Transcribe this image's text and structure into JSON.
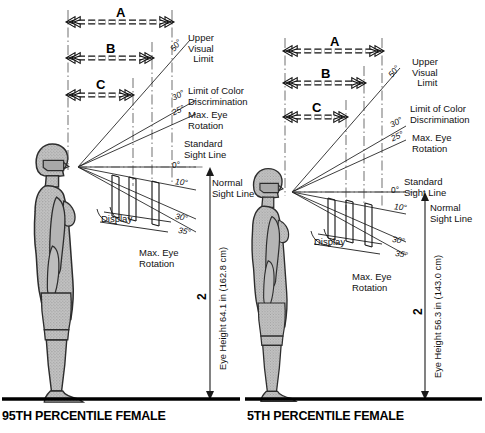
{
  "figure": {
    "title_visible": false,
    "figure_number": "2",
    "colors": {
      "body_fill": "#b9b9b9",
      "body_outline": "#2a2a2a",
      "line": "#1a1a1a",
      "ground": "#000000",
      "text": "#111111",
      "background": "#ffffff"
    }
  },
  "panels": [
    {
      "id": "left",
      "caption": "95TH PERCENTILE FEMALE",
      "eye_height_label": "Eye Height 64.1 in (162.8 cm)",
      "eye_height_in": 64.1,
      "eye_height_cm": 162.8,
      "figure_number": "2",
      "dimension_arrows": [
        {
          "label": "A"
        },
        {
          "label": "B"
        },
        {
          "label": "C"
        }
      ],
      "sight_lines": [
        {
          "angle_label": "50°",
          "name": "Upper Visual Limit"
        },
        {
          "angle_label": "30°",
          "name": "Limit of Color Discrimination"
        },
        {
          "angle_label": "25°",
          "name": "Max. Eye Rotation"
        },
        {
          "angle_label": "0°",
          "name": "Standard Sight Line"
        },
        {
          "angle_label": "10°",
          "name": "Normal Sight Line"
        },
        {
          "angle_label": "30°",
          "name": "Max. Eye Rotation lower"
        },
        {
          "angle_label": "35°",
          "name": "Max. Eye Rotation lower limit"
        }
      ],
      "callouts": {
        "upper_visual_limit": "Upper\nVisual\n  Limit",
        "limit_of_color": "Limit of Color\nDiscrimination",
        "max_eye_rotation_upper": "Max. Eye\nRotation",
        "standard_sight_line": "Standard\nSight Line",
        "normal_sight_line": "Normal\nSight Line",
        "display": "Display",
        "max_eye_rotation_lower": "Max. Eye\nRotation"
      },
      "angles": {
        "a50": "50°",
        "a30u": "30°",
        "a25": "25°",
        "a0": "0°",
        "a10": "10°",
        "a30l": "30°",
        "a35": "35°"
      }
    },
    {
      "id": "right",
      "caption": "5TH PERCENTILE FEMALE",
      "eye_height_label": "Eye Height 56.3 in (143.0 cm)",
      "eye_height_in": 56.3,
      "eye_height_cm": 143.0,
      "figure_number": "2",
      "dimension_arrows": [
        {
          "label": "A"
        },
        {
          "label": "B"
        },
        {
          "label": "C"
        }
      ],
      "sight_lines": [
        {
          "angle_label": "50°",
          "name": "Upper Visual Limit"
        },
        {
          "angle_label": "30°",
          "name": "Limit of Color Discrimination"
        },
        {
          "angle_label": "25°",
          "name": "Max. Eye Rotation"
        },
        {
          "angle_label": "0°",
          "name": "Standard Sight Line"
        },
        {
          "angle_label": "10°",
          "name": "Normal Sight Line"
        },
        {
          "angle_label": "30°",
          "name": "Max. Eye Rotation lower"
        },
        {
          "angle_label": "35°",
          "name": "Max. Eye Rotation lower limit"
        }
      ],
      "callouts": {
        "upper_visual_limit": "Upper\nVisual\n  Limit",
        "limit_of_color": "Limit of Color\nDiscrimination",
        "max_eye_rotation_upper": "Max. Eye\nRotation",
        "standard_sight_line": "Standard\nSight Line",
        "normal_sight_line": "Normal\nSight Line",
        "display": "Display",
        "max_eye_rotation_lower": "Max. Eye\nRotation"
      },
      "angles": {
        "a50": "50°",
        "a30u": "30°",
        "a25": "25°",
        "a0": "0°",
        "a10": "10°",
        "a30l": "30°",
        "a35": "35°"
      }
    }
  ]
}
